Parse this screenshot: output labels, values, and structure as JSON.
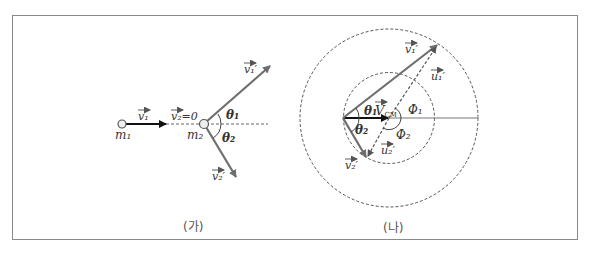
{
  "figure": {
    "panel_a": {
      "caption": "(가)",
      "labels": {
        "m1": "m₁",
        "m2": "m₂",
        "v1": "v₁",
        "v2_zero": "v₂=0",
        "v1_prime": "v₁′",
        "v2_prime": "v₂′",
        "theta1": "θ₁",
        "theta2": "θ₂"
      }
    },
    "panel_b": {
      "caption": "(나)",
      "labels": {
        "v1_prime": "v₁′",
        "v2_prime": "v₂′",
        "u1_prime": "u₁′",
        "u2_prime": "u₂′",
        "V_CM": "V",
        "V_CM_sub": "CM",
        "theta1": "θ₁",
        "theta2": "θ₂",
        "phi1": "Φ₁",
        "phi2": "Φ₂"
      }
    },
    "colors": {
      "frame": "#8a8a8a",
      "vector_gray": "#6e6e6e",
      "vector_black": "#111111",
      "dashed": "#555555"
    }
  }
}
